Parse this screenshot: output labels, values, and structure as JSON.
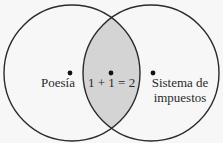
{
  "diagram": {
    "type": "venn",
    "background_color": "#f7f7f7",
    "stroke_color": "#2b2b2b",
    "intersection_fill": "#d4d4d4",
    "sets": [
      {
        "id": "left",
        "label": "Poesía"
      },
      {
        "id": "right",
        "label_line1": "Sistema de",
        "label_line2": "impuestos"
      }
    ],
    "intersection": {
      "label": "1 + 1 = 2"
    }
  }
}
